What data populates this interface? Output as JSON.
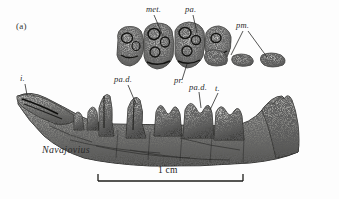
{
  "figure": {
    "panel_label": "(a)",
    "genus_label": "Navajovius",
    "scale_bar_label": "1 cm",
    "background_color": "#fdfdfd",
    "ink_color": "#2a2a2a"
  },
  "annotations": [
    {
      "id": "met",
      "text": "met.",
      "x": 148,
      "y": 10,
      "target_x": 163,
      "target_y": 35
    },
    {
      "id": "pa",
      "text": "pa.",
      "x": 186,
      "y": 10,
      "target_x": 196,
      "target_y": 32
    },
    {
      "id": "pm",
      "text": "pm.",
      "x": 240,
      "y": 25,
      "target_x": 232,
      "target_y": 56,
      "target2_x": 265,
      "target2_y": 58
    },
    {
      "id": "pad1",
      "text": "pa.d.",
      "x": 119,
      "y": 80,
      "target_x": 134,
      "target_y": 104
    },
    {
      "id": "pr",
      "text": "pr.",
      "x": 177,
      "y": 82,
      "target_x": 184,
      "target_y": 63
    },
    {
      "id": "pad2",
      "text": "pa.d.",
      "x": 192,
      "y": 87,
      "target_x": 200,
      "target_y": 107
    },
    {
      "id": "t",
      "text": "t.",
      "x": 216,
      "y": 88,
      "target_x": 209,
      "target_y": 108
    },
    {
      "id": "i",
      "text": "i.",
      "x": 22,
      "y": 79,
      "target_x": 26,
      "target_y": 96
    }
  ],
  "scale_bar": {
    "x_left": 98,
    "x_right": 243,
    "y": 181,
    "tick_height": 7,
    "label_x": 170,
    "label_y": 170
  },
  "specimens": [
    {
      "id": "upper-tooth-row",
      "description": "upper dentition, occlusal view"
    },
    {
      "id": "lower-jaw",
      "description": "lower jaw, lateral view"
    }
  ]
}
